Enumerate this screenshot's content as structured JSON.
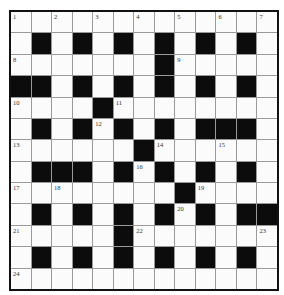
{
  "puzzle": {
    "rows": 13,
    "cols": 13,
    "colors": {
      "black": "#0c0c0c",
      "white": "#fbfbfb",
      "border": "#111111",
      "gridline": "#9a9a9a"
    },
    "grid": [
      ".............",
      ".#.#.#.#.#.#.",
      ".......#.....",
      "##.#.#.#.#.#.",
      "....#........",
      ".#.#.#.#.###.",
      "......#......",
      ".###.#.#.#.#.",
      "........#....",
      ".#.#.#.#.#.##",
      ".....#.......",
      ".#.#.#.#.#.#.",
      "............."
    ],
    "numbers": [
      {
        "n": "1",
        "r": 0,
        "c": 0
      },
      {
        "n": "2",
        "r": 0,
        "c": 2
      },
      {
        "n": "3",
        "r": 0,
        "c": 4
      },
      {
        "n": "4",
        "r": 0,
        "c": 6
      },
      {
        "n": "5",
        "r": 0,
        "c": 8
      },
      {
        "n": "6",
        "r": 0,
        "c": 10
      },
      {
        "n": "7",
        "r": 0,
        "c": 12
      },
      {
        "n": "8",
        "r": 2,
        "c": 0
      },
      {
        "n": "9",
        "r": 2,
        "c": 8
      },
      {
        "n": "10",
        "r": 4,
        "c": 0
      },
      {
        "n": "11",
        "r": 4,
        "c": 5
      },
      {
        "n": "12",
        "r": 5,
        "c": 4
      },
      {
        "n": "13",
        "r": 6,
        "c": 0
      },
      {
        "n": "14",
        "r": 6,
        "c": 7
      },
      {
        "n": "15",
        "r": 6,
        "c": 10
      },
      {
        "n": "16",
        "r": 7,
        "c": 6
      },
      {
        "n": "17",
        "r": 8,
        "c": 0
      },
      {
        "n": "18",
        "r": 8,
        "c": 2
      },
      {
        "n": "19",
        "r": 8,
        "c": 9
      },
      {
        "n": "20",
        "r": 9,
        "c": 8
      },
      {
        "n": "21",
        "r": 10,
        "c": 0
      },
      {
        "n": "22",
        "r": 10,
        "c": 6
      },
      {
        "n": "23",
        "r": 10,
        "c": 12
      },
      {
        "n": "24",
        "r": 12,
        "c": 0
      }
    ]
  }
}
